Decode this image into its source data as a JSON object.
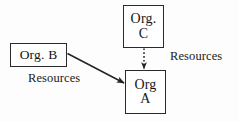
{
  "diagram": {
    "background_color": "#fdfdfd",
    "stroke_color": "#2a2a2a",
    "text_color": "#1a1a1a",
    "nodes": [
      {
        "id": "org-c",
        "line1": "Org.",
        "line2": "C",
        "x": 123,
        "y": 5,
        "width": 41,
        "height": 43
      },
      {
        "id": "org-b",
        "line1": "Org. B",
        "line2": "",
        "x": 10,
        "y": 43,
        "width": 57,
        "height": 24
      },
      {
        "id": "org-a",
        "line1": "Org",
        "line2": "A",
        "x": 125,
        "y": 70,
        "width": 41,
        "height": 44
      }
    ],
    "edges": [
      {
        "id": "edge-c-to-a",
        "from": "org-c",
        "to": "org-a",
        "style": "dotted",
        "label": "Resources"
      },
      {
        "id": "edge-b-to-a",
        "from": "org-b",
        "to": "org-a",
        "style": "solid",
        "label": "Resources"
      }
    ],
    "labels": {
      "resources_right": "Resources",
      "resources_left": "Resources"
    }
  }
}
